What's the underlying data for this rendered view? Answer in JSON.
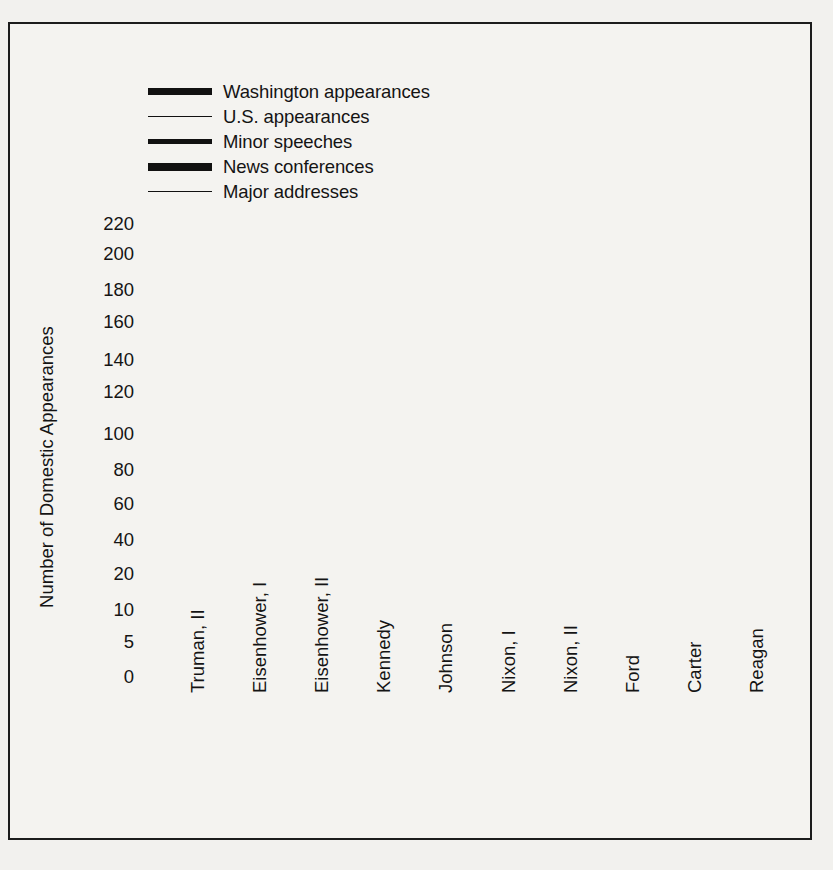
{
  "figure": {
    "border_color": "#1c1c1c",
    "background": "#f4f3f0",
    "ink_color": "#111111"
  },
  "axes": {
    "ylabel": "Number of Domestic Appearances",
    "ytick_labels": [
      "0",
      "5",
      "10",
      "20",
      "40",
      "60",
      "80",
      "100",
      "120",
      "140",
      "160",
      "180",
      "200",
      "220"
    ],
    "xtick_labels": [
      "Truman, II",
      "Eisenhower, I",
      "Eisenhower, II",
      "Kennedy",
      "Johnson",
      "Nixon, I",
      "Nixon, II",
      "Ford",
      "Carter",
      "Reagan"
    ]
  },
  "legend": {
    "items": [
      {
        "label": "Washington appearances",
        "swatch": "thick-rule-icon",
        "style": "sw-w"
      },
      {
        "label": "U.S. appearances",
        "swatch": "thin-rule-icon",
        "style": "sw-us"
      },
      {
        "label": "Minor speeches",
        "swatch": "medium-rule-icon",
        "style": "sw-minor"
      },
      {
        "label": "News conferences",
        "swatch": "extra-thick-rule-icon",
        "style": "sw-news"
      },
      {
        "label": "Major addresses",
        "swatch": "hairline-rule-icon",
        "style": "sw-major"
      }
    ]
  },
  "chart_data": {
    "type": "line",
    "title": "",
    "xlabel": "",
    "ylabel": "Number of Domestic Appearances",
    "categories": [
      "Truman, II",
      "Eisenhower, I",
      "Eisenhower, II",
      "Kennedy",
      "Johnson",
      "Nixon, I",
      "Nixon, II",
      "Ford",
      "Carter",
      "Reagan"
    ],
    "ytick_values": [
      0,
      5,
      10,
      20,
      40,
      60,
      80,
      100,
      120,
      140,
      160,
      180,
      200,
      220
    ],
    "y_scale": "piecewise-nonlinear",
    "ylim": [
      0,
      220
    ],
    "grid": false,
    "legend_position": "top-left",
    "series": [
      {
        "name": "Washington appearances",
        "line_width": 7,
        "values": [
          65,
          34,
          45,
          147,
          205,
          92,
          72,
          207,
          185,
          217
        ]
      },
      {
        "name": "U.S. appearances",
        "line_width": 1.6,
        "values": [
          13,
          21,
          12,
          30,
          51,
          48,
          27,
          89,
          53,
          73
        ]
      },
      {
        "name": "Minor speeches",
        "line_width": 5,
        "values": [
          39,
          25,
          25,
          27,
          29,
          19,
          8,
          45,
          31,
          32
        ]
      },
      {
        "name": "News conferences",
        "line_width": 8,
        "values": [
          39,
          25,
          25,
          27,
          29,
          9.5,
          6,
          26,
          19,
          9.5
        ]
      },
      {
        "name": "Major addresses",
        "line_width": 1.8,
        "values": [
          4.5,
          5,
          5.2,
          5.6,
          6,
          6.2,
          6.3,
          6.4,
          6.6,
          8
        ]
      }
    ]
  }
}
